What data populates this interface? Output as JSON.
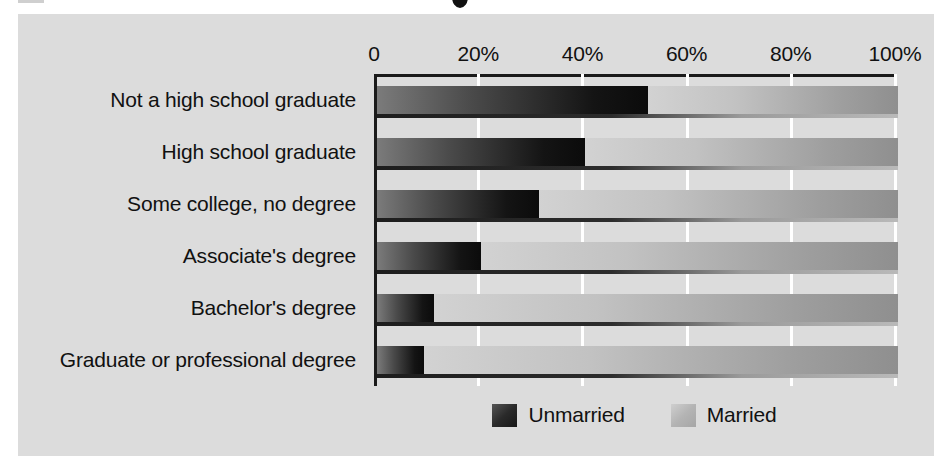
{
  "figure": {
    "background_color": "#dcdcdc",
    "page_color": "#ffffff"
  },
  "legend": {
    "position": "bottom-center",
    "items": [
      {
        "label": "Unmarried",
        "swatch": "dark-gradient-swatch",
        "color": "#1a1a1a"
      },
      {
        "label": "Married",
        "swatch": "light-gradient-swatch",
        "color": "#b4b4b4"
      }
    ]
  },
  "chart_data": {
    "type": "bar",
    "orientation": "horizontal",
    "stacked": true,
    "stacked_100": true,
    "title": "",
    "xlabel": "",
    "ylabel": "",
    "xlim": [
      0,
      100
    ],
    "xticks": [
      0,
      20,
      40,
      60,
      80,
      100
    ],
    "xticklabels": [
      "0",
      "20%",
      "40%",
      "60%",
      "80%",
      "100%"
    ],
    "grid": "vertical-white-gridlines",
    "categories": [
      "Not a high school graduate",
      "High school graduate",
      "Some college, no degree",
      "Associate's degree",
      "Bachelor's degree",
      "Graduate or professional degree"
    ],
    "series": [
      {
        "name": "Unmarried",
        "color": "#1a1a1a",
        "values": [
          52,
          40,
          31,
          20,
          11,
          9
        ]
      },
      {
        "name": "Married",
        "color": "#b4b4b4",
        "values": [
          48,
          60,
          69,
          80,
          89,
          91
        ]
      }
    ]
  }
}
